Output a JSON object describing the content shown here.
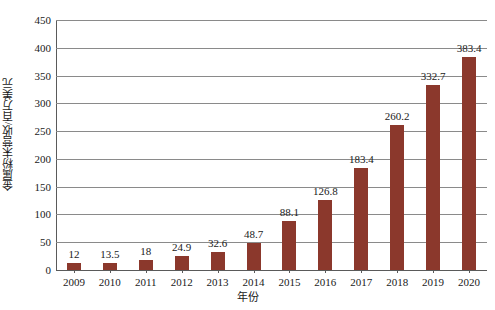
{
  "chart_data": {
    "type": "bar",
    "title": "",
    "xlabel": "年份",
    "ylabel": "金属粉末营收/百万美元",
    "categories": [
      "2009",
      "2010",
      "2011",
      "2012",
      "2013",
      "2014",
      "2015",
      "2016",
      "2017",
      "2018",
      "2019",
      "2020"
    ],
    "values": [
      12,
      13.5,
      18,
      24.9,
      32.6,
      48.7,
      88.1,
      126.8,
      183.4,
      260.2,
      332.7,
      383.4
    ],
    "value_labels": [
      "12",
      "13.5",
      "18",
      "24.9",
      "32.6",
      "48.7",
      "88.1",
      "126.8",
      "183.4",
      "260.2",
      "332.7",
      "383.4"
    ],
    "ylim": [
      0,
      450
    ],
    "ytick_step": 50,
    "yticks": [
      0,
      50,
      100,
      150,
      200,
      250,
      300,
      350,
      400,
      450
    ],
    "ytick_labels": [
      "0",
      "50",
      "100",
      "150",
      "200",
      "250",
      "300",
      "350",
      "400",
      "450"
    ],
    "grid": true,
    "legend": false,
    "series_color": "#8B382C",
    "gridline_color": "#8a8a8a",
    "axis_color": "#5a5a5a",
    "background": "#ffffff"
  }
}
